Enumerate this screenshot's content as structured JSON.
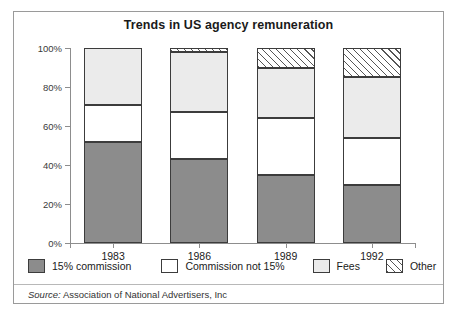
{
  "figure": {
    "title": "Trends in US agency remuneration",
    "source_prefix": "Source:",
    "source_text": "Association of National Advertisers, Inc"
  },
  "colors": {
    "commission_15": "#8c8c8c",
    "commission_not_15": "#ffffff",
    "fees": "#ebebeb",
    "other": "#ffffff",
    "outline": "#3c3c3c",
    "axis": "#8d8d8d",
    "border": "#9a9a9a"
  },
  "legend": [
    {
      "label": "15% commission",
      "swatch": "dark-gray-swatch"
    },
    {
      "label": "Commission not 15%",
      "swatch": "white-swatch"
    },
    {
      "label": "Fees",
      "swatch": "light-gray-swatch"
    },
    {
      "label": "Other",
      "swatch": "hatched-swatch"
    }
  ],
  "chart_data": {
    "type": "bar",
    "stacked": true,
    "normalized": "100%",
    "title": "Trends in US agency remuneration",
    "xlabel": "",
    "ylabel": "",
    "categories": [
      "1983",
      "1986",
      "1989",
      "1992"
    ],
    "ylim": [
      0,
      100
    ],
    "yticks": [
      0,
      20,
      40,
      60,
      80,
      100
    ],
    "ytick_labels": [
      "0%",
      "20%",
      "40%",
      "60%",
      "80%",
      "100%"
    ],
    "grid": false,
    "legend_position": "below-axis",
    "series": [
      {
        "name": "15% commission",
        "values": [
          52,
          43,
          35,
          30
        ]
      },
      {
        "name": "Commission not 15%",
        "values": [
          19,
          24,
          29,
          24
        ]
      },
      {
        "name": "Fees",
        "values": [
          29,
          31,
          26,
          31
        ]
      },
      {
        "name": "Other",
        "values": [
          0,
          2,
          10,
          15
        ]
      }
    ]
  }
}
